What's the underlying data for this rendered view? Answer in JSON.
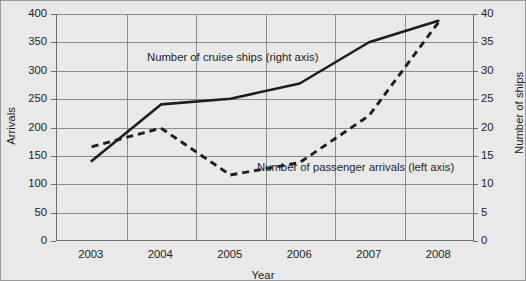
{
  "chart_data": {
    "type": "line",
    "title": "",
    "xlabel": "Year",
    "ylabel": "Arrivals",
    "ylabel_right": "Number of ships",
    "categories": [
      "2003",
      "2004",
      "2005",
      "2006",
      "2007",
      "2008"
    ],
    "x": [
      2003,
      2004,
      2005,
      2006,
      2007,
      2008
    ],
    "ylim": [
      0,
      400
    ],
    "ylim_right": [
      0,
      40
    ],
    "yticks": [
      0,
      50,
      100,
      150,
      200,
      250,
      300,
      350,
      400
    ],
    "yticks_right": [
      0,
      5,
      10,
      15,
      20,
      25,
      30,
      35,
      40
    ],
    "grid": true,
    "legend_position": "inline-annotation",
    "series": [
      {
        "name": "Number of cruise ships (right axis)",
        "axis": "right",
        "style": "solid",
        "color": "#1d1d1d",
        "values": [
          14.0,
          24.0,
          25.0,
          27.7,
          35.0,
          38.8
        ]
      },
      {
        "name": "Number of passenger arrivals (left axis)",
        "axis": "left",
        "style": "dashed",
        "color": "#1d1d1d",
        "values": [
          165,
          198,
          115,
          137,
          220,
          385
        ]
      }
    ],
    "annotations": [
      {
        "text": "Number of cruise ships (right axis)",
        "x": 2003.55,
        "y_left": 322
      },
      {
        "text": "Number of passenger arrivals (left axis)",
        "x": 2005.45,
        "y_left": 128
      }
    ]
  },
  "axes": {
    "left_title": "Arrivals",
    "right_title": "Number of ships",
    "x_title": "Year",
    "left_ticks": [
      "400",
      "350",
      "300",
      "250",
      "200",
      "150",
      "100",
      "50",
      "0"
    ],
    "right_ticks": [
      "40",
      "35",
      "30",
      "25",
      "20",
      "15",
      "10",
      "5",
      "0"
    ],
    "x_ticks": [
      "2003",
      "2004",
      "2005",
      "2006",
      "2007",
      "2008"
    ]
  },
  "series_labels": {
    "cruise_ships": "Number of cruise ships (right axis)",
    "passenger_arrivals": "Number of passenger arrivals (left axis)"
  }
}
